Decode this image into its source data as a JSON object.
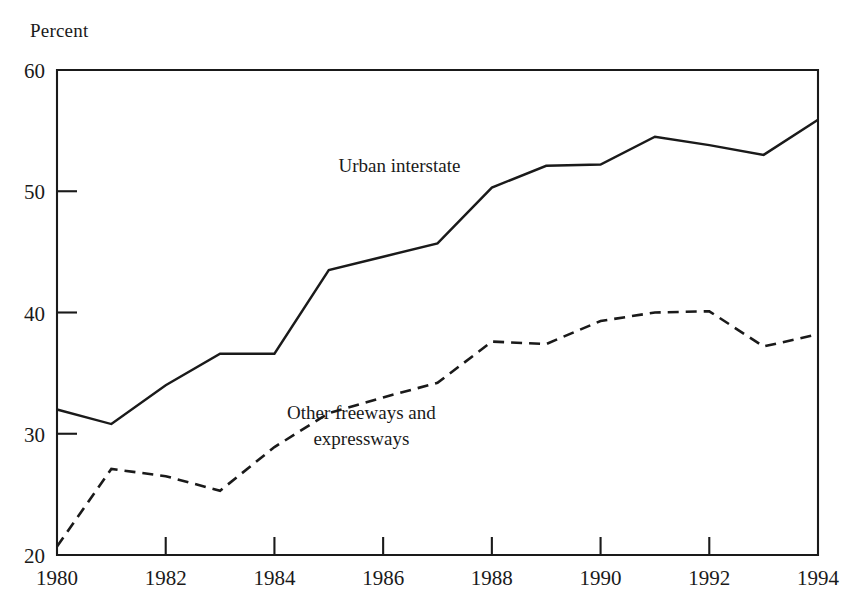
{
  "chart_data": {
    "type": "line",
    "title": "",
    "subtitle": "",
    "xlabel": "",
    "ylabel": "Percent",
    "ylabel_position": "top-left",
    "grid": false,
    "legend": "inline-annotations",
    "xlim": [
      1980,
      1994
    ],
    "ylim": [
      20,
      60
    ],
    "x": [
      1980,
      1981,
      1982,
      1983,
      1984,
      1985,
      1986,
      1987,
      1988,
      1989,
      1990,
      1991,
      1992,
      1993,
      1994
    ],
    "x_tick_values": [
      1980,
      1982,
      1984,
      1986,
      1988,
      1990,
      1992,
      1994
    ],
    "x_tick_labels": [
      "1980",
      "1982",
      "1984",
      "1986",
      "1988",
      "1990",
      "1992",
      "1994"
    ],
    "y_tick_values": [
      20,
      30,
      40,
      50,
      60
    ],
    "y_tick_labels": [
      "20",
      "30",
      "40",
      "50",
      "60"
    ],
    "series": [
      {
        "name": "Urban interstate",
        "style": "solid",
        "label_text": "Urban interstate",
        "label_x": 1986.3,
        "label_y": 51.6,
        "values": [
          32.0,
          30.8,
          34.0,
          36.6,
          36.6,
          43.5,
          44.6,
          45.7,
          50.3,
          52.1,
          52.2,
          54.5,
          53.8,
          53.0,
          55.9
        ]
      },
      {
        "name": "Other freeways and expressways",
        "style": "dashed",
        "label_text_line1": "Other freeways and",
        "label_text_line2": "expressways",
        "label_x": 1985.6,
        "label_y": 31.2,
        "values": [
          20.7,
          27.1,
          26.5,
          25.3,
          28.9,
          31.7,
          33.0,
          34.2,
          37.6,
          37.4,
          39.3,
          40.0,
          40.1,
          37.2,
          38.2
        ]
      }
    ]
  },
  "axis": {
    "unit_label": "Percent"
  }
}
